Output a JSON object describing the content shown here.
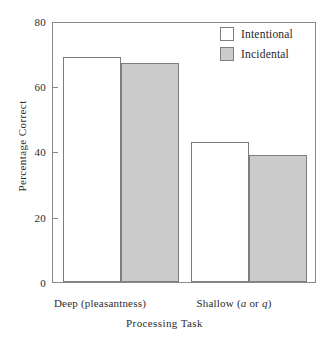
{
  "chart_data": {
    "type": "bar",
    "title": "",
    "subtitle": "",
    "xlabel": "Processing Task",
    "ylabel": "Percentage Correct",
    "categories": [
      "Deep (pleasantness)",
      "Shallow (a or q)"
    ],
    "category_labels_html": [
      "Deep (pleasantness)",
      "Shallow (<i>a</i> or <i>q</i>)"
    ],
    "series": [
      {
        "name": "Intentional",
        "values": [
          69,
          43
        ],
        "color": "#ffffff",
        "edge_color": "#7d7d7d"
      },
      {
        "name": "Incidental",
        "values": [
          67,
          39
        ],
        "color": "#cbcbcb",
        "edge_color": "#7d7d7d"
      }
    ],
    "ylim": [
      0,
      80
    ],
    "yticks": [
      0,
      20,
      40,
      60,
      80
    ],
    "ytick_labels": [
      "0",
      "20",
      "40",
      "60",
      "80"
    ],
    "xticks_shown": false,
    "grid": false,
    "legend_position": "top-right",
    "frame": "full-box",
    "bar_group_gap": true
  },
  "axes": {
    "y_title": "Percentage Correct",
    "x_title": "Processing Task",
    "y_ticks": [
      {
        "label": "80",
        "value": 80
      },
      {
        "label": "60",
        "value": 60
      },
      {
        "label": "40",
        "value": 40
      },
      {
        "label": "20",
        "value": 20
      },
      {
        "label": "0",
        "value": 0
      }
    ]
  },
  "legend": {
    "items": [
      {
        "label": "Intentional",
        "swatch": "white"
      },
      {
        "label": "Incidental",
        "swatch": "gray"
      }
    ]
  },
  "colors": {
    "bar_white_fill": "#ffffff",
    "bar_gray_fill": "#cbcbcb",
    "bar_edge": "#7d7d7d",
    "frame": "#8a8a8a",
    "text": "#2b2b2b",
    "background": "#ffffff"
  }
}
